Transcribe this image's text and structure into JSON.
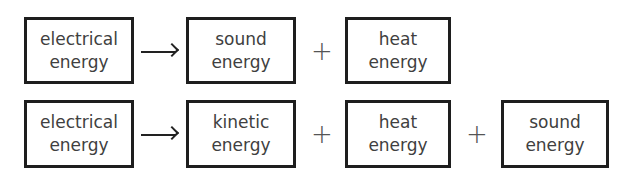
{
  "rows": [
    {
      "input": {
        "line1": "electrical",
        "line2": "energy"
      },
      "arrow": "→",
      "outputs": [
        {
          "line1": "sound",
          "line2": "energy"
        },
        {
          "line1": "heat",
          "line2": "energy"
        }
      ],
      "operator": "+"
    },
    {
      "input": {
        "line1": "electrical",
        "line2": "energy"
      },
      "arrow": "→",
      "outputs": [
        {
          "line1": "kinetic",
          "line2": "energy"
        },
        {
          "line1": "heat",
          "line2": "energy"
        },
        {
          "line1": "sound",
          "line2": "energy"
        }
      ],
      "operator": "+"
    }
  ]
}
